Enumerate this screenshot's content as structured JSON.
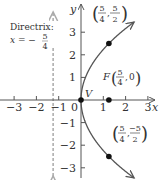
{
  "figure": {
    "equation": "y^2 = 5x",
    "p": 1.25,
    "x_range": [
      -3.2,
      3.3
    ],
    "y_range": [
      -3.5,
      3.6
    ],
    "x_ticks": [
      -3,
      -2,
      -1,
      1,
      2,
      3
    ],
    "y_ticks": [
      -3,
      -2,
      -1,
      1,
      2,
      3
    ],
    "x_tick_labels": [
      "−3",
      "−2",
      "−1",
      "1",
      "2",
      "3"
    ],
    "y_tick_labels": [
      "−3",
      "−2",
      "−1",
      "1",
      "2",
      "3"
    ],
    "origin_label": "0",
    "x_axis_label": "x",
    "y_axis_label": "y",
    "vertex": {
      "label": "V",
      "x": 0,
      "y": 0
    },
    "focus": {
      "label": "F",
      "x": 1.25,
      "y": 0,
      "coord_num": "5",
      "coord_den": "4",
      "coord_second": "0"
    },
    "directrix": {
      "title": "Directrix:",
      "eq_prefix": "x = −",
      "num": "5",
      "den": "4",
      "x": -1.25
    },
    "points": [
      {
        "x": 1.25,
        "y": 2.5,
        "num1": "5",
        "den1": "4",
        "num2": "5",
        "den2": "2"
      },
      {
        "x": 1.25,
        "y": -2.5,
        "num1": "5",
        "den1": "4",
        "num2": "−5",
        "den2": "2"
      }
    ],
    "colors": {
      "axis": "#555555",
      "curve": "#555555",
      "directrix": "#aaaaaa",
      "point": "#111111",
      "text": "#333333"
    }
  }
}
